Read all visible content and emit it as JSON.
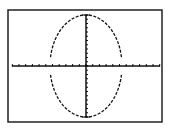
{
  "graph": {
    "type": "calculator-graph",
    "frame": {
      "x": 8,
      "y": 10,
      "width": 154,
      "height": 112,
      "color": "#222222"
    },
    "axes": {
      "origin": {
        "x": 86,
        "y": 66
      },
      "x_axis": {
        "x_start": 12,
        "x_end": 160,
        "tick_spacing": 6.7,
        "tick_len": 2
      },
      "y_axis": {
        "y_start": 15,
        "y_end": 117,
        "tick_spacing": 4.25,
        "tick_len": 2
      },
      "color": "#111111"
    },
    "curve": {
      "shape": "ellipse",
      "center": {
        "x": 86,
        "y": 66
      },
      "rx": 36,
      "ry": 51,
      "style": "dashed",
      "gap_near_x_axis_deg": 10,
      "color": "#111111"
    }
  }
}
